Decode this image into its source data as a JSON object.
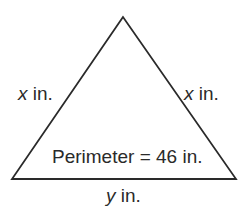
{
  "diagram": {
    "shape": "triangle",
    "type": "isosceles",
    "vertices": {
      "apex": [
        123,
        17
      ],
      "bottom_left": [
        12,
        179
      ],
      "bottom_right": [
        236,
        179
      ]
    },
    "stroke_color": "#2a2a2a",
    "labels": {
      "left_side": {
        "var": "x",
        "unit": "in."
      },
      "right_side": {
        "var": "x",
        "unit": "in."
      },
      "base": {
        "var": "y",
        "unit": "in."
      },
      "perimeter": "Perimeter = 46 in."
    }
  }
}
